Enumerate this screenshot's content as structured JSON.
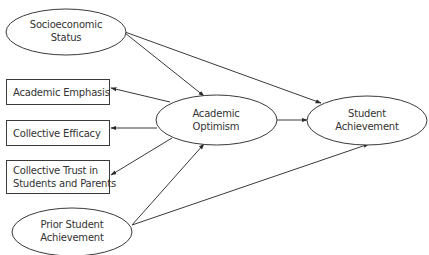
{
  "diagram": {
    "type": "path-model",
    "colors": {
      "stroke": "#3a3a3a",
      "text": "#333333",
      "background": "#ffffff"
    },
    "nodes": {
      "ses": {
        "shape": "ellipse",
        "lines": [
          "Socioeconomic",
          "Status"
        ]
      },
      "academic_emphasis": {
        "shape": "rectangle",
        "lines": [
          "Academic Emphasis"
        ]
      },
      "collective_efficacy": {
        "shape": "rectangle",
        "lines": [
          "Collective Efficacy"
        ]
      },
      "collective_trust": {
        "shape": "rectangle",
        "lines": [
          "Collective Trust in",
          "Students and Parents"
        ]
      },
      "prior_achievement": {
        "shape": "ellipse",
        "lines": [
          "Prior Student",
          "Achievement"
        ]
      },
      "academic_optimism": {
        "shape": "ellipse",
        "lines": [
          "Academic",
          "Optimism"
        ]
      },
      "student_achievement": {
        "shape": "ellipse",
        "lines": [
          "Student",
          "Achievement"
        ]
      }
    },
    "edges": [
      {
        "from": "Socioeconomic Status",
        "to": "Academic Optimism"
      },
      {
        "from": "Socioeconomic Status",
        "to": "Student Achievement"
      },
      {
        "from": "Academic Optimism",
        "to": "Academic Emphasis"
      },
      {
        "from": "Academic Optimism",
        "to": "Collective Efficacy"
      },
      {
        "from": "Academic Optimism",
        "to": "Collective Trust in Students and Parents"
      },
      {
        "from": "Academic Optimism",
        "to": "Student Achievement"
      },
      {
        "from": "Prior Student Achievement",
        "to": "Academic Optimism"
      },
      {
        "from": "Prior Student Achievement",
        "to": "Student Achievement"
      }
    ]
  }
}
